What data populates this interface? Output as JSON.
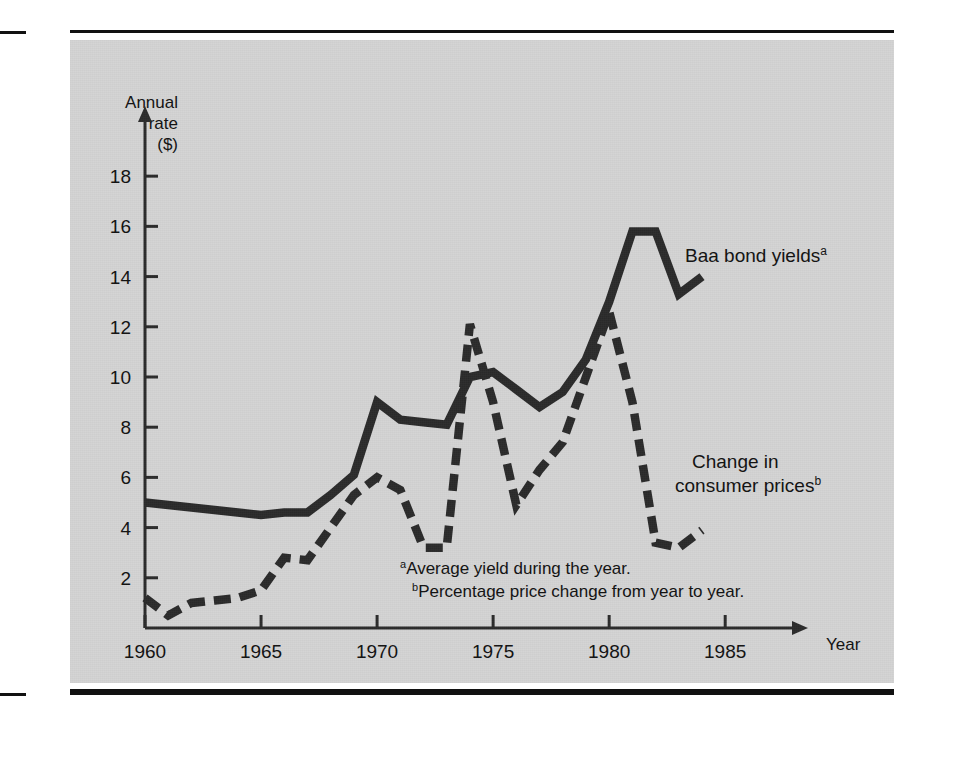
{
  "page": {
    "background_color": "#ffffff",
    "panel_color": "#d4d4d4",
    "ink_color": "#2b2b2b"
  },
  "chart_data": {
    "type": "line",
    "title": "",
    "subtitle": "",
    "xlabel": "Year",
    "ylabel": "Annual rate ($)",
    "ylabel_lines": [
      "Annual",
      "rate",
      "($)"
    ],
    "xlim": [
      1960,
      1986.5
    ],
    "ylim": [
      0,
      19.6
    ],
    "grid": false,
    "legend": "inline-annotations",
    "x_ticks": [
      1960,
      1965,
      1970,
      1975,
      1980,
      1985
    ],
    "x_tick_labels": [
      "1960",
      "1965",
      "1970",
      "1975",
      "1980",
      "1985"
    ],
    "y_ticks": [
      2,
      4,
      6,
      8,
      10,
      12,
      14,
      16,
      18
    ],
    "y_tick_labels": [
      "2",
      "4",
      "6",
      "8",
      "10",
      "12",
      "14",
      "16",
      "18"
    ],
    "x": [
      1960,
      1961,
      1962,
      1963,
      1964,
      1965,
      1966,
      1967,
      1968,
      1969,
      1970,
      1971,
      1972,
      1973,
      1974,
      1975,
      1976,
      1977,
      1978,
      1979,
      1980,
      1981,
      1982,
      1983,
      1984
    ],
    "series": [
      {
        "name": "Baa bond yields",
        "footnote_marker": "a",
        "style": "solid",
        "color": "#2b2b2b",
        "label_lines": [
          "Baa bond yields"
        ],
        "values": [
          5.0,
          4.9,
          4.8,
          4.7,
          4.6,
          4.5,
          4.6,
          4.6,
          5.3,
          6.1,
          9.0,
          8.3,
          8.2,
          8.1,
          10.0,
          10.2,
          9.5,
          8.8,
          9.4,
          10.7,
          13.0,
          15.8,
          15.8,
          13.3,
          14.0
        ]
      },
      {
        "name": "Change in consumer prices",
        "footnote_marker": "b",
        "style": "dashed",
        "color": "#2b2b2b",
        "label_lines": [
          "Change in",
          "consumer prices"
        ],
        "values": [
          1.2,
          0.5,
          1.0,
          1.1,
          1.2,
          1.5,
          2.8,
          2.7,
          4.0,
          5.3,
          6.0,
          5.5,
          3.2,
          3.2,
          12.1,
          9.0,
          4.9,
          6.3,
          7.4,
          10.0,
          12.6,
          9.0,
          3.4,
          3.2,
          3.9
        ]
      }
    ],
    "annotations": [
      {
        "id": "series-label-baa",
        "text": "Baa bond yields",
        "sup": "a",
        "x": 1983.2,
        "y": 14.6
      },
      {
        "id": "series-label-cpi",
        "text_lines": [
          "Change in",
          "consumer prices"
        ],
        "sup": "b",
        "x": 1983.6,
        "y": 5.9
      }
    ],
    "footnotes": [
      {
        "marker": "a",
        "text": "Average yield during the year."
      },
      {
        "marker": "b",
        "text": "Percentage price change from year to year."
      }
    ]
  }
}
